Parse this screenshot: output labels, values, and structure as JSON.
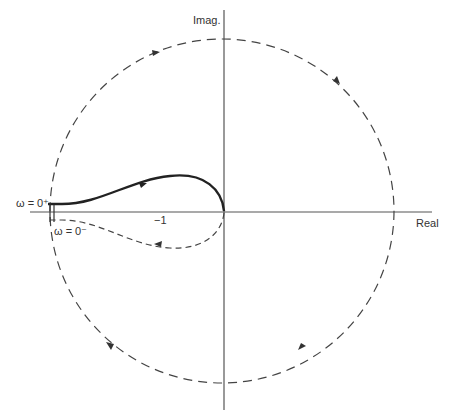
{
  "axes": {
    "imag_label": "Imag.",
    "real_label": "Real",
    "tick_minus_one": "−1"
  },
  "labels": {
    "omega_zero_plus": "ω = 0⁺",
    "omega_zero_minus": "ω = 0⁻"
  },
  "colors": {
    "stroke": "#333333",
    "background": "#ffffff"
  },
  "diagram": {
    "type": "nyquist-plot",
    "elements": [
      "large dashed semicircle-at-infinity contour (clockwise arrows)",
      "solid curve from omega=0+ to origin (upper half)",
      "dashed mirror curve from origin to omega=0- (lower half)",
      "small indentation at omega=0"
    ]
  }
}
